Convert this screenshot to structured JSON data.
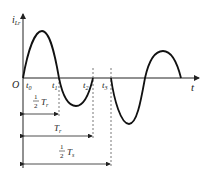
{
  "diagram": {
    "y_axis": {
      "symbol": "i",
      "subscript": "Lr"
    },
    "x_axis": {
      "symbol": "t"
    },
    "origin_label": "O",
    "time_marks": [
      {
        "symbol": "t",
        "sub": "0"
      },
      {
        "symbol": "t",
        "sub": "1"
      },
      {
        "symbol": "t",
        "sub": "2"
      },
      {
        "symbol": "t",
        "sub": "3"
      }
    ],
    "intervals": [
      {
        "fraction": "1/2",
        "num": "1",
        "den": "2",
        "symbol": "T",
        "sub": "r"
      },
      {
        "symbol": "T",
        "sub": "r"
      },
      {
        "fraction": "1/2",
        "num": "1",
        "den": "2",
        "symbol": "T",
        "sub": "s"
      }
    ],
    "colors": {
      "curve": "#111111",
      "axis": "#222222",
      "dashed": "#555555"
    }
  }
}
